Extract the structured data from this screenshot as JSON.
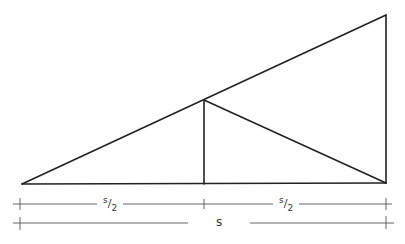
{
  "diagram": {
    "type": "geometric-construction",
    "points": {
      "A_left_base": [
        22,
        184
      ],
      "B_right_base": [
        386,
        183
      ],
      "C_top_right": [
        386,
        15
      ],
      "M_base_mid": [
        204,
        184
      ],
      "P_hyp_mid": [
        204,
        100
      ]
    },
    "segments": [
      {
        "from": "A_left_base",
        "to": "B_right_base",
        "role": "base"
      },
      {
        "from": "B_right_base",
        "to": "C_top_right",
        "role": "vertical-leg"
      },
      {
        "from": "A_left_base",
        "to": "C_top_right",
        "role": "hypotenuse"
      },
      {
        "from": "M_base_mid",
        "to": "P_hyp_mid",
        "role": "perpendicular"
      },
      {
        "from": "P_hyp_mid",
        "to": "B_right_base",
        "role": "diagonal"
      }
    ],
    "dimensions": [
      {
        "label_num": "s",
        "label_den": "2",
        "span": "left half"
      },
      {
        "label_num": "s",
        "label_den": "2",
        "span": "right half"
      },
      {
        "label": "s",
        "span": "full base"
      }
    ],
    "line_color": "#222222",
    "dim_color": "#555555"
  }
}
